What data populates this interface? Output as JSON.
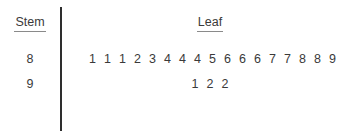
{
  "chart_data": {
    "type": "table",
    "title": "",
    "headers": [
      "Stem",
      "Leaf"
    ],
    "rows": [
      {
        "stem": "8",
        "leaves": [
          "1",
          "1",
          "1",
          "2",
          "3",
          "4",
          "4",
          "4",
          "5",
          "6",
          "6",
          "6",
          "7",
          "7",
          "8",
          "8",
          "9"
        ]
      },
      {
        "stem": "9",
        "leaves": [
          "1",
          "2",
          "2"
        ]
      }
    ],
    "values": [
      81,
      81,
      81,
      82,
      83,
      84,
      84,
      84,
      85,
      86,
      86,
      86,
      87,
      87,
      88,
      88,
      89,
      91,
      92,
      92
    ],
    "xlabel": "",
    "ylabel": "",
    "colors": {
      "text": "#3a3a3a",
      "divider": "#2e2e2e",
      "underline": "#8a8a8a",
      "background": "#ffffff"
    }
  }
}
